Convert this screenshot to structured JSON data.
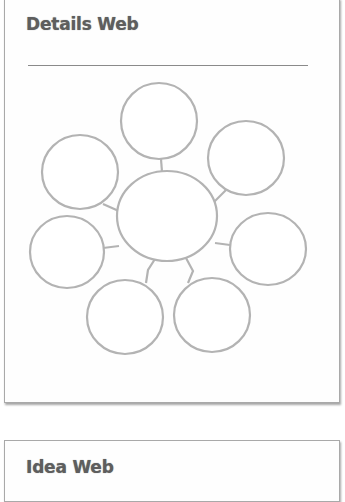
{
  "details_web": {
    "title": "Details Web",
    "center_node": {
      "label": "",
      "cx": 167,
      "cy": 216,
      "rx": 50,
      "ry": 45
    },
    "nodes": [
      {
        "name": "top",
        "label": "",
        "cx": 159,
        "cy": 121,
        "rx": 38,
        "ry": 38
      },
      {
        "name": "upper-left",
        "label": "",
        "cx": 80,
        "cy": 172,
        "rx": 38,
        "ry": 37
      },
      {
        "name": "upper-right",
        "label": "",
        "cx": 246,
        "cy": 158,
        "rx": 38,
        "ry": 37
      },
      {
        "name": "left",
        "label": "",
        "cx": 67,
        "cy": 252,
        "rx": 37,
        "ry": 36
      },
      {
        "name": "right",
        "label": "",
        "cx": 268,
        "cy": 249,
        "rx": 38,
        "ry": 36
      },
      {
        "name": "bottom-left",
        "label": "",
        "cx": 125,
        "cy": 317,
        "rx": 38,
        "ry": 37
      },
      {
        "name": "bottom-right",
        "label": "",
        "cx": 212,
        "cy": 315,
        "rx": 38,
        "ry": 37
      }
    ],
    "stroke_color": "#b3b3b3"
  },
  "idea_web": {
    "title": "Idea Web"
  }
}
